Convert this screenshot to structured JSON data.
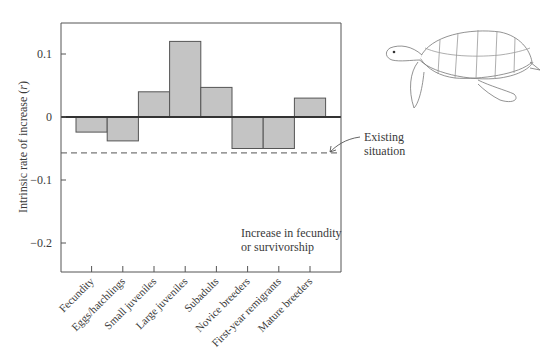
{
  "chart_data": {
    "type": "bar",
    "title": "",
    "xlabel": "",
    "ylabel": "Intrinsic rate of increase (r)",
    "ylim": [
      -0.245,
      0.15
    ],
    "yticks": [
      0.1,
      0,
      -0.1,
      -0.2
    ],
    "ytick_labels": [
      "0.1",
      "0",
      "−0.1",
      "−0.2"
    ],
    "grid": false,
    "categories": [
      "Fecundity",
      "Eggs/hatchlings",
      "Small juveniles",
      "Large juveniles",
      "Subadults",
      "Novice breeders",
      "First-year remigrants",
      "Mature breeders"
    ],
    "values": [
      -0.024,
      -0.038,
      0.04,
      0.12,
      0.047,
      -0.05,
      -0.05,
      0.03
    ],
    "bar_color": "#c4c4c4",
    "bar_edge_color": "#555555",
    "reference_line": {
      "value": -0.057,
      "style": "dashed",
      "label": "Existing situation"
    },
    "annotations": [
      {
        "text": "Existing situation",
        "points_to": "reference_line"
      },
      {
        "text": "Increase in fecundity or survivorship",
        "position": "lower-right inside plot"
      }
    ],
    "illustration": "sea-turtle drawing, top right"
  },
  "labels": {
    "ylabel": "Intrinsic rate of increase (r)",
    "ylabel_main": "Intrinsic rate of increase (",
    "ylabel_var": "r",
    "ylabel_close": ")",
    "existing_1": "Existing",
    "existing_2": "situation",
    "increase_1": "Increase in fecundity",
    "increase_2": "or survivorship"
  }
}
